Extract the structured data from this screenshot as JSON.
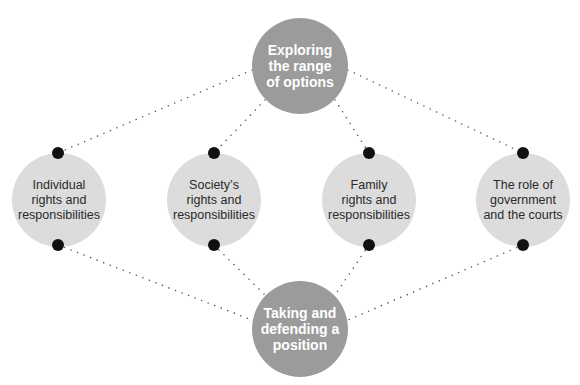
{
  "diagram": {
    "type": "concept-diamond",
    "colors": {
      "main_node_fill": "#9b9b9b",
      "main_node_text": "#ffffff",
      "topic_node_fill": "#dcdcdc",
      "topic_node_text": "#2a2a2a",
      "connector": "#555555",
      "pin": "#111111"
    },
    "top_node": {
      "label": "Exploring the range of options",
      "lines": [
        "Exploring",
        "the range",
        "of options"
      ]
    },
    "bottom_node": {
      "label": "Taking and defending a position",
      "lines": [
        "Taking and",
        "defending a",
        "position"
      ]
    },
    "topics": [
      {
        "label": "Individual rights and responsibilities",
        "lines": [
          "Individual",
          "rights and",
          "responsibilities"
        ]
      },
      {
        "label": "Society's rights and responsibilities",
        "lines": [
          "Society’s",
          "rights and",
          "responsibilities"
        ]
      },
      {
        "label": "Family rights and responsibilities",
        "lines": [
          "Family",
          "rights and",
          "responsibilities"
        ]
      },
      {
        "label": "The role of government and the courts",
        "lines": [
          "The role of",
          "government",
          "and the courts"
        ]
      }
    ],
    "connections": [
      {
        "from": "top_node",
        "to": "topics.0",
        "style": "dotted"
      },
      {
        "from": "top_node",
        "to": "topics.1",
        "style": "dotted"
      },
      {
        "from": "top_node",
        "to": "topics.2",
        "style": "dotted"
      },
      {
        "from": "top_node",
        "to": "topics.3",
        "style": "dotted"
      },
      {
        "from": "topics.0",
        "to": "bottom_node",
        "style": "dotted"
      },
      {
        "from": "topics.1",
        "to": "bottom_node",
        "style": "dotted"
      },
      {
        "from": "topics.2",
        "to": "bottom_node",
        "style": "dotted"
      },
      {
        "from": "topics.3",
        "to": "bottom_node",
        "style": "dotted"
      }
    ]
  }
}
